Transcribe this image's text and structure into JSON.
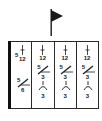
{
  "diagram": {
    "flag_icon": "flag-icon",
    "columns": [
      {
        "top_symbol": "tie-mark",
        "top_prefix": "5",
        "top_number": "12",
        "mid_upper": "5",
        "mid_lower": "6",
        "bottom_number": ""
      },
      {
        "top_symbol": "tie-mark",
        "top_number": "12",
        "mid_upper": "5",
        "mid_lower": "3",
        "bottom_number": "3"
      },
      {
        "top_symbol": "tie-mark",
        "top_number": "12",
        "mid_upper": "5",
        "mid_lower": "3",
        "bottom_number": "3"
      },
      {
        "top_symbol": "tie-mark",
        "top_number": "12",
        "mid_upper": "5",
        "mid_lower": "3",
        "bottom_number": "3"
      }
    ],
    "colors": {
      "ink": "#1a1a1a",
      "background": "#ffffff"
    }
  }
}
